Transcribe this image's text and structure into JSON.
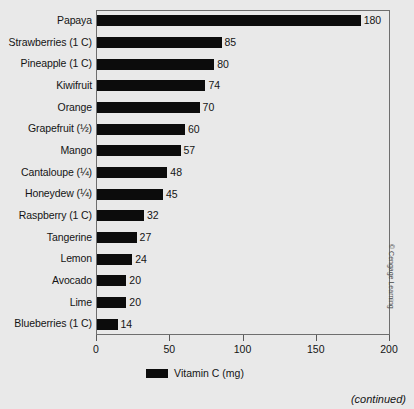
{
  "credit": "© Cengage Learning",
  "continued_note": "(continued)",
  "legend": {
    "swatch_name": "vitamin-c-swatch",
    "label": "Vitamin C (mg)"
  },
  "chart_data": {
    "type": "bar",
    "orientation": "horizontal",
    "title": "",
    "subtitle": "",
    "xlabel": "Vitamin C (mg)",
    "ylabel": "",
    "xlim": [
      0,
      200
    ],
    "xticks": [
      0,
      50,
      100,
      150,
      200
    ],
    "xtick_labels": [
      "0",
      "50",
      "100",
      "150",
      "200"
    ],
    "grid": false,
    "legend_position": "bottom-center",
    "series_name": "Vitamin C (mg)",
    "bar_color": "#0c0c0c",
    "categories": [
      "Papaya",
      "Strawberries (1 C)",
      "Pineapple (1 C)",
      "Kiwifruit",
      "Orange",
      "Grapefruit (½)",
      "Mango",
      "Cantaloupe (¼)",
      "Honeydew (¼)",
      "Raspberry (1 C)",
      "Tangerine",
      "Lemon",
      "Avocado",
      "Lime",
      "Blueberries (1 C)"
    ],
    "values": [
      180,
      85,
      80,
      74,
      70,
      60,
      57,
      48,
      45,
      32,
      27,
      24,
      20,
      20,
      14
    ],
    "value_labels": [
      "180",
      "85",
      "80",
      "74",
      "70",
      "60",
      "57",
      "48",
      "45",
      "32",
      "27",
      "24",
      "20",
      "20",
      "14"
    ]
  }
}
